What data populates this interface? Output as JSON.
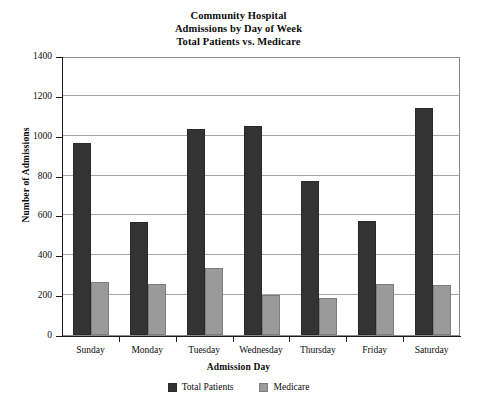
{
  "chart_data": {
    "type": "bar",
    "title": "Community Hospital Admissions by Day of Week Total Patients vs. Medicare",
    "title_lines": [
      "Community Hospital",
      "Admissions by Day of Week",
      "Total Patients vs. Medicare"
    ],
    "categories": [
      "Sunday",
      "Monday",
      "Tuesday",
      "Wednesday",
      "Thursday",
      "Friday",
      "Saturday"
    ],
    "series": [
      {
        "name": "Total Patients",
        "color": "#333333",
        "values": [
          965,
          565,
          1035,
          1050,
          775,
          570,
          1140
        ]
      },
      {
        "name": "Medicare",
        "color": "#9a9a9a",
        "values": [
          265,
          255,
          335,
          200,
          185,
          255,
          250
        ]
      }
    ],
    "xlabel": "Admission Day",
    "ylabel": "Number of Admissions",
    "ylim": [
      0,
      1400
    ],
    "ytick_step": 200,
    "yticks": [
      0,
      200,
      400,
      600,
      800,
      1000,
      1200,
      1400
    ],
    "ytick_labels": [
      "0",
      "200",
      "400",
      "600",
      "800",
      "1000",
      "1200",
      "1400"
    ],
    "grid": true,
    "grid_axis": "y",
    "legend_position": "bottom",
    "background_color": "#ffffff",
    "frame_color": "#8a8a8a"
  }
}
